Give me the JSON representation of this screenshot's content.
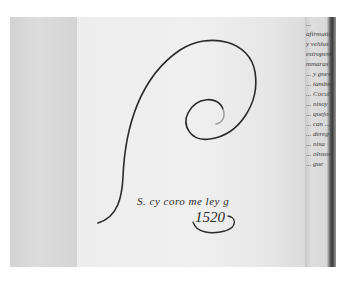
{
  "image": {
    "description": "Photograph of an open historical manuscript showing a large looping calligraphic flourish with a short handwritten line and date",
    "colors": {
      "border": "#ffffff",
      "paper_main": "#eeeeee",
      "paper_left": "#d6d6d6",
      "gutter_shadow": "#3a3a3a",
      "ink": "#2a2a2a"
    }
  },
  "handwriting": {
    "main_line": "S. cy coro me ley g",
    "date": "1520"
  },
  "margin_text": {
    "lines": [
      "...",
      "afirmationes",
      "y vehius",
      "estropeniens",
      "mmaras",
      "... y gnev",
      "... tambien",
      "... Cocul",
      "... nisoy",
      "... quejo ...",
      "... can ...",
      "... dereg ...",
      "... nisa",
      "... olnsos",
      "... gue"
    ]
  }
}
